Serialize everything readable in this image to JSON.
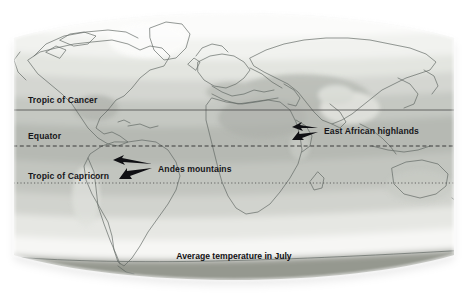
{
  "figure": {
    "kind": "world-map",
    "caption": "Average temperature in July",
    "projection_note": "equirectangular world map, desaturated grayscale"
  },
  "latitude_lines": [
    {
      "id": "tropic-of-cancer",
      "label": "Tropic of Cancer",
      "style": "solid",
      "y": 110
    },
    {
      "id": "equator",
      "label": "Equator",
      "style": "dashed",
      "y": 146
    },
    {
      "id": "tropic-of-capricorn",
      "label": "Tropic of Capricorn",
      "style": "dotted",
      "y": 183
    }
  ],
  "annotations": [
    {
      "id": "east-african-highlands",
      "label": "East African highlands",
      "arrows": 2,
      "text_x": 324,
      "text_y": 134
    },
    {
      "id": "andes-mountains",
      "label": "Andes mountains",
      "arrows": 2,
      "text_x": 158,
      "text_y": 172
    }
  ],
  "colors": {
    "page_background": "#ffffff",
    "ocean_warm": "#b9bcb7",
    "band_hot": "#a9aca6",
    "band_warm": "#c3c6c0",
    "band_mild": "#d2d4cf",
    "band_cool": "#e4e5e1",
    "band_cold": "#f2f2ef",
    "band_polar": "#fbfbfa",
    "band_antarctic": "#8f928c",
    "coastline": "#5e6460",
    "label_text": "#16161a",
    "shadow": "#cfcfcf"
  },
  "map_bands": {
    "description": "Latitudinal temperature bands shaded from pale (cold) to mid grey (hot)",
    "order_north_to_south": [
      "band_polar",
      "band_cold",
      "band_cool",
      "band_mild",
      "band_warm",
      "band_hot",
      "band_warm",
      "band_mild",
      "band_cool",
      "band_cold",
      "band_polar",
      "band_antarctic"
    ]
  }
}
